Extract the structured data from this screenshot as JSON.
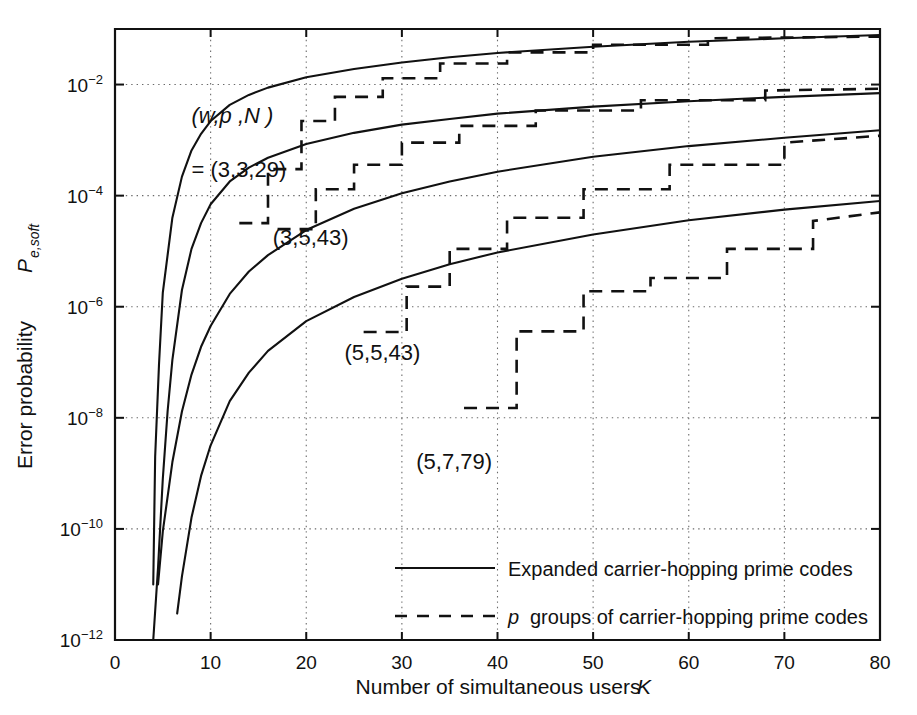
{
  "chart_data": {
    "type": "line",
    "title": "",
    "xlabel": "Number of simultaneous users   K",
    "xlabel_main": "Number of simultaneous users",
    "xlabel_symbol": "K",
    "ylabel_main": "Error probability",
    "ylabel_symbol": "P",
    "ylabel_subscript": "e,soft",
    "xlim": [
      0,
      80
    ],
    "ylim": [
      1e-12,
      0.1
    ],
    "yscale": "log",
    "xticks": [
      0,
      10,
      20,
      30,
      40,
      50,
      60,
      70,
      80
    ],
    "xtick_labels": [
      "0",
      "10",
      "20",
      "30",
      "40",
      "50",
      "60",
      "70",
      "80"
    ],
    "yticks_exponents": [
      -2,
      -4,
      -6,
      -8,
      -10,
      -12
    ],
    "ytick_labels": [
      "10⁻²",
      "10⁻⁴",
      "10⁻⁶",
      "10⁻⁸",
      "10⁻¹⁰",
      "10⁻¹²"
    ],
    "grid": true,
    "grid_style": "dotted",
    "legend_position": "lower-center",
    "annotations": [
      {
        "name": "parameter-key-line1",
        "text": "(w,p ,N )",
        "x": 8.0,
        "y": 0.002
      },
      {
        "name": "parameter-key-line2",
        "text": "= (3,3,29)",
        "x": 8.0,
        "y": 0.00022
      },
      {
        "name": "curve-label-3-5-43",
        "text": "(3,5,43)",
        "x": 16.5,
        "y": 1.3e-05
      },
      {
        "name": "curve-label-5-5-43",
        "text": "(5,5,43)",
        "x": 24.0,
        "y": 1.1e-07
      },
      {
        "name": "curve-label-5-7-79",
        "text": "(5,7,79)",
        "x": 31.5,
        "y": 1.2e-09
      }
    ],
    "series": [
      {
        "name": "Expanded carrier-hopping prime codes (3,3,29)",
        "style": "solid",
        "label": "(3,3,29)",
        "points": [
          [
            4.0,
            1e-11
          ],
          [
            4.2,
            2e-09
          ],
          [
            4.6,
            9e-08
          ],
          [
            5.0,
            1.8e-06
          ],
          [
            6.0,
            4e-05
          ],
          [
            7.0,
            0.00022
          ],
          [
            8.0,
            0.00065
          ],
          [
            9.0,
            0.0013
          ],
          [
            10.0,
            0.0022
          ],
          [
            12.0,
            0.0043
          ],
          [
            14.0,
            0.0065
          ],
          [
            16.0,
            0.0088
          ],
          [
            20.0,
            0.0135
          ],
          [
            25.0,
            0.019
          ],
          [
            30.0,
            0.025
          ],
          [
            35.0,
            0.031
          ],
          [
            40.0,
            0.037
          ],
          [
            50.0,
            0.048
          ],
          [
            60.0,
            0.059
          ],
          [
            70.0,
            0.068
          ],
          [
            80.0,
            0.078
          ]
        ]
      },
      {
        "name": "p groups of carrier-hopping prime codes (3,3,29)",
        "style": "dashed",
        "label": "(3,3,29)",
        "points": [
          [
            13.0,
            3.2e-05
          ],
          [
            16.0,
            3.2e-05
          ],
          [
            16.0,
            0.0003
          ],
          [
            19.5,
            0.0003
          ],
          [
            19.5,
            0.0022
          ],
          [
            23.0,
            0.0022
          ],
          [
            23.0,
            0.006
          ],
          [
            28.0,
            0.006
          ],
          [
            28.0,
            0.013
          ],
          [
            34.0,
            0.013
          ],
          [
            34.0,
            0.024
          ],
          [
            41.0,
            0.024
          ],
          [
            41.0,
            0.038
          ],
          [
            50.0,
            0.038
          ],
          [
            50.0,
            0.052
          ],
          [
            62.0,
            0.052
          ],
          [
            62.0,
            0.068
          ],
          [
            80.0,
            0.073
          ]
        ]
      },
      {
        "name": "Expanded carrier-hopping prime codes (3,5,43)",
        "style": "solid",
        "label": "(3,5,43)",
        "points": [
          [
            4.0,
            1e-12
          ],
          [
            4.5,
            2e-11
          ],
          [
            5.0,
            8e-10
          ],
          [
            5.5,
            1.3e-08
          ],
          [
            6.0,
            1.1e-07
          ],
          [
            7.0,
            2e-06
          ],
          [
            8.0,
            1.1e-05
          ],
          [
            9.0,
            3.2e-05
          ],
          [
            10.0,
            7e-05
          ],
          [
            12.0,
            0.00018
          ],
          [
            14.0,
            0.00032
          ],
          [
            16.0,
            0.00048
          ],
          [
            20.0,
            0.00085
          ],
          [
            25.0,
            0.00135
          ],
          [
            30.0,
            0.0019
          ],
          [
            35.0,
            0.0024
          ],
          [
            40.0,
            0.003
          ],
          [
            50.0,
            0.004
          ],
          [
            60.0,
            0.005
          ],
          [
            70.0,
            0.006
          ],
          [
            80.0,
            0.007
          ]
        ]
      },
      {
        "name": "p groups of carrier-hopping prime codes (3,5,43)",
        "style": "dashed",
        "label": "(3,5,43)",
        "points": [
          [
            17.0,
            2.5e-05
          ],
          [
            21.0,
            2.5e-05
          ],
          [
            21.0,
            0.00013
          ],
          [
            25.0,
            0.00013
          ],
          [
            25.0,
            0.00036
          ],
          [
            30.0,
            0.00036
          ],
          [
            30.0,
            0.0009
          ],
          [
            36.0,
            0.0009
          ],
          [
            36.0,
            0.0018
          ],
          [
            44.0,
            0.0018
          ],
          [
            44.0,
            0.0034
          ],
          [
            55.0,
            0.0034
          ],
          [
            55.0,
            0.0052
          ],
          [
            68.0,
            0.0052
          ],
          [
            68.0,
            0.0078
          ],
          [
            80.0,
            0.0084
          ]
        ]
      },
      {
        "name": "Expanded carrier-hopping prime codes (5,5,43)",
        "style": "solid",
        "label": "(5,5,43)",
        "points": [
          [
            4.5,
            1e-11
          ],
          [
            5.0,
            9e-11
          ],
          [
            6.0,
            1.6e-09
          ],
          [
            7.0,
            1.3e-08
          ],
          [
            8.0,
            6e-08
          ],
          [
            9.0,
            1.9e-07
          ],
          [
            10.0,
            4.5e-07
          ],
          [
            12.0,
            1.7e-06
          ],
          [
            14.0,
            4.3e-06
          ],
          [
            16.0,
            8.5e-06
          ],
          [
            20.0,
            2.4e-05
          ],
          [
            25.0,
            5.8e-05
          ],
          [
            30.0,
            0.00011
          ],
          [
            35.0,
            0.00018
          ],
          [
            40.0,
            0.00027
          ],
          [
            50.0,
            0.0005
          ],
          [
            60.0,
            0.00078
          ],
          [
            70.0,
            0.0011
          ],
          [
            80.0,
            0.0015
          ]
        ]
      },
      {
        "name": "p groups of carrier-hopping prime codes (5,5,43)",
        "style": "dashed",
        "label": "(5,5,43)",
        "points": [
          [
            26.0,
            3.5e-07
          ],
          [
            30.5,
            3.5e-07
          ],
          [
            30.5,
            2.3e-06
          ],
          [
            35.0,
            2.3e-06
          ],
          [
            35.0,
            1.1e-05
          ],
          [
            41.0,
            1.1e-05
          ],
          [
            41.0,
            4e-05
          ],
          [
            49.0,
            4e-05
          ],
          [
            49.0,
            0.00013
          ],
          [
            58.0,
            0.00013
          ],
          [
            58.0,
            0.00036
          ],
          [
            70.0,
            0.00036
          ],
          [
            70.0,
            0.0009
          ],
          [
            80.0,
            0.0012
          ]
        ]
      },
      {
        "name": "Expanded carrier-hopping prime codes (5,7,79)",
        "style": "solid",
        "label": "(5,7,79)",
        "points": [
          [
            6.5,
            3e-12
          ],
          [
            7.0,
            1.4e-11
          ],
          [
            8.0,
            1.6e-10
          ],
          [
            9.0,
            9e-10
          ],
          [
            10.0,
            3.2e-09
          ],
          [
            12.0,
            2e-08
          ],
          [
            14.0,
            6.5e-08
          ],
          [
            16.0,
            1.6e-07
          ],
          [
            20.0,
            5.5e-07
          ],
          [
            25.0,
            1.5e-06
          ],
          [
            30.0,
            3.2e-06
          ],
          [
            35.0,
            5.8e-06
          ],
          [
            40.0,
            9.5e-06
          ],
          [
            50.0,
            2e-05
          ],
          [
            60.0,
            3.6e-05
          ],
          [
            70.0,
            5.6e-05
          ],
          [
            80.0,
            8e-05
          ]
        ]
      },
      {
        "name": "p groups of carrier-hopping prime codes (5,7,79)",
        "style": "dashed",
        "label": "(5,7,79)",
        "points": [
          [
            36.5,
            1.5e-08
          ],
          [
            42.0,
            1.5e-08
          ],
          [
            42.0,
            3.6e-07
          ],
          [
            49.0,
            3.6e-07
          ],
          [
            49.0,
            1.9e-06
          ],
          [
            56.0,
            1.9e-06
          ],
          [
            56.0,
            3.3e-06
          ],
          [
            64.0,
            3.3e-06
          ],
          [
            64.0,
            1.1e-05
          ],
          [
            73.0,
            1.1e-05
          ],
          [
            73.0,
            3.5e-05
          ],
          [
            80.0,
            5e-05
          ]
        ]
      }
    ],
    "legend": [
      {
        "style": "solid",
        "label": "Expanded carrier-hopping prime codes",
        "italic_prefix": ""
      },
      {
        "style": "dashed",
        "label": "groups of carrier-hopping prime codes",
        "italic_prefix": "p"
      }
    ]
  }
}
